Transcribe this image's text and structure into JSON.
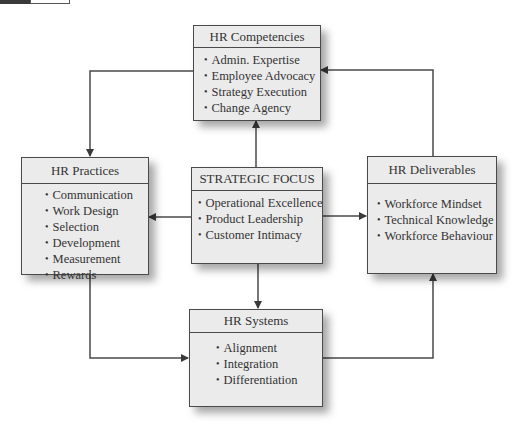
{
  "diagram": {
    "boxes": {
      "competencies": {
        "title": "HR Competencies",
        "items": [
          "Admin. Expertise",
          "Employee Advocacy",
          "Strategy Execution",
          "Change Agency"
        ]
      },
      "practices": {
        "title": "HR Practices",
        "items": [
          "Communication",
          "Work Design",
          "Selection",
          "Development",
          "Measurement",
          "Rewards"
        ]
      },
      "strategic_focus": {
        "title": "STRATEGIC FOCUS",
        "items": [
          "Operational Excellence",
          "Product Leadership",
          "Customer Intimacy"
        ]
      },
      "deliverables": {
        "title": "HR Deliverables",
        "items": [
          "Workforce Mindset",
          "Technical Knowledge",
          "Workforce Behaviour"
        ]
      },
      "systems": {
        "title": "HR Systems",
        "items": [
          "Alignment",
          "Integration",
          "Differentiation"
        ]
      }
    },
    "connections": [
      {
        "from": "strategic_focus",
        "to": "competencies"
      },
      {
        "from": "strategic_focus",
        "to": "practices"
      },
      {
        "from": "strategic_focus",
        "to": "deliverables"
      },
      {
        "from": "strategic_focus",
        "to": "systems"
      },
      {
        "from": "competencies",
        "to": "practices"
      },
      {
        "from": "practices",
        "to": "systems"
      },
      {
        "from": "systems",
        "to": "deliverables"
      },
      {
        "from": "deliverables",
        "to": "competencies"
      }
    ],
    "colors": {
      "box_fill": "#ebebeb",
      "border": "#4a4a4a",
      "text": "#333333"
    }
  }
}
